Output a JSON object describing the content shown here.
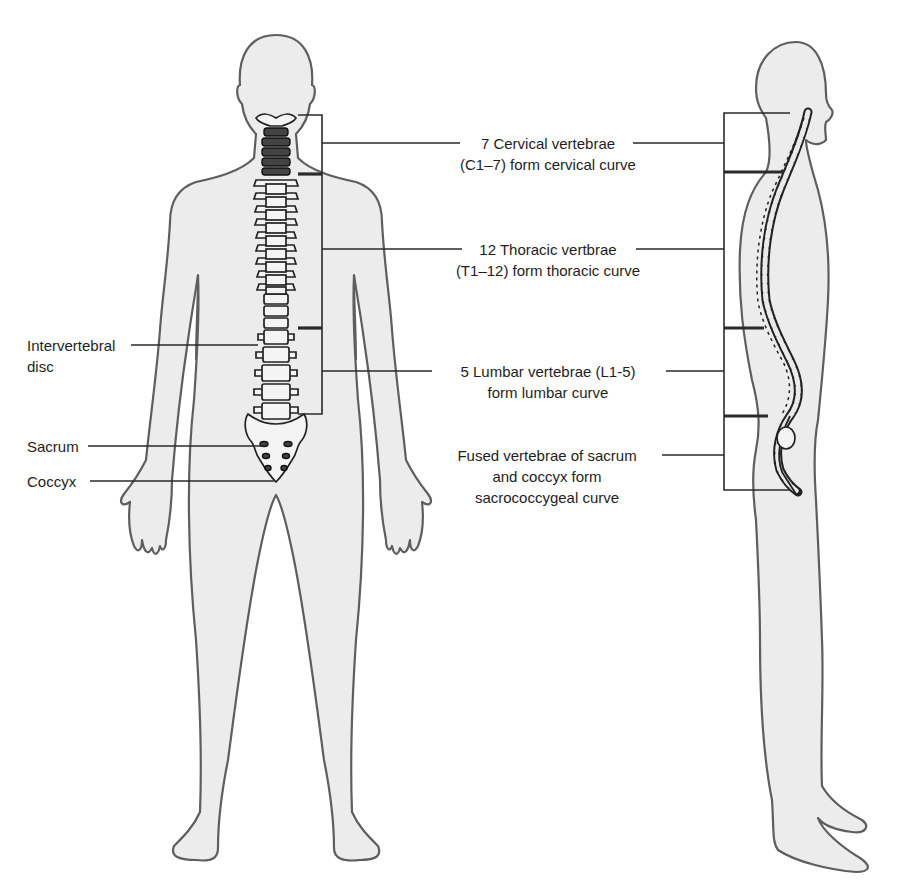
{
  "diagram": {
    "title": "",
    "colors": {
      "figure_fill": "#ececec",
      "figure_outline": "#5e5e5e",
      "lines": "#2a2a2a",
      "text": "#1e1e1e"
    },
    "left_labels": [
      {
        "id": "intervertebral-disc",
        "lines": [
          "Intervertebral",
          "disc"
        ]
      },
      {
        "id": "sacrum",
        "lines": [
          "Sacrum"
        ]
      },
      {
        "id": "coccyx",
        "lines": [
          "Coccyx"
        ]
      }
    ],
    "center_labels": [
      {
        "id": "cervical",
        "lines": [
          "7 Cervical vertebrae",
          "(C1–7) form cervical curve"
        ]
      },
      {
        "id": "thoracic",
        "lines": [
          "12 Thoracic vertbrae",
          "(T1–12) form thoracic curve"
        ]
      },
      {
        "id": "lumbar",
        "lines": [
          "5 Lumbar vertebrae (L1-5)",
          "form lumbar curve"
        ]
      },
      {
        "id": "sacrococcygeal",
        "lines": [
          "Fused vertebrae of sacrum",
          "and coccyx form",
          "sacrococcygeal curve"
        ]
      }
    ],
    "vertebra_numbers": {
      "thoracic": [
        "1",
        "2",
        "3",
        "4",
        "5",
        "6",
        "7",
        "8",
        "9",
        "10",
        "11",
        "12"
      ],
      "lumbar": [
        "1",
        "2",
        "3",
        "4",
        "5"
      ]
    }
  }
}
